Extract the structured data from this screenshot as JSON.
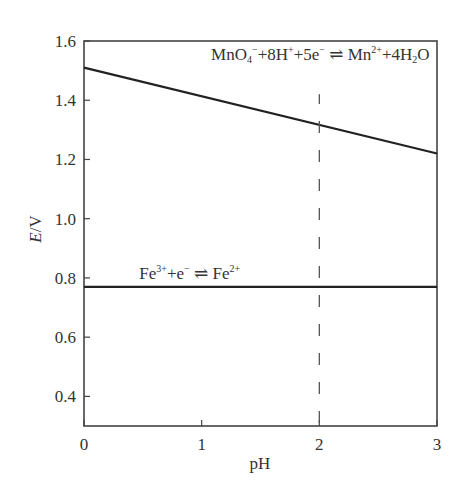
{
  "chart_data": {
    "type": "line",
    "title": "",
    "xlabel": "pH",
    "ylabel_italic": "E",
    "ylabel_rest": "/V",
    "ylabel": "E/V",
    "xlim": [
      0,
      3
    ],
    "ylim": [
      0.3,
      1.6
    ],
    "grid": false,
    "legend": "none",
    "xticks": [
      0,
      1,
      2,
      3
    ],
    "xtick_labels": [
      "0",
      "1",
      "2",
      "3"
    ],
    "yticks": [
      0.4,
      0.6,
      0.8,
      1.0,
      1.2,
      1.4,
      1.6
    ],
    "ytick_labels": [
      "0.4",
      "0.6",
      "0.8",
      "1.0",
      "1.2",
      "1.4",
      "1.6"
    ],
    "series": [
      {
        "name": "MnO4- + 8H+ + 5e- ⇌ Mn2+ + 4H2O",
        "style": "solid",
        "x": [
          0,
          3
        ],
        "values": [
          1.51,
          1.22
        ]
      },
      {
        "name": "Fe3+ + e- ⇌ Fe2+",
        "style": "solid",
        "x": [
          0,
          3
        ],
        "values": [
          0.77,
          0.77
        ]
      },
      {
        "name": "pH = 2 reference",
        "style": "dashed",
        "x": [
          2,
          2
        ],
        "values": [
          0.31,
          1.42
        ]
      }
    ],
    "annotations": [
      {
        "id": "mno4",
        "parts": [
          {
            "t": "MnO",
            "s": "n"
          },
          {
            "t": "4",
            "s": "sub"
          },
          {
            "t": "−",
            "s": "sup"
          },
          {
            "t": "+8H",
            "s": "n"
          },
          {
            "t": "+",
            "s": "sup"
          },
          {
            "t": "+5e",
            "s": "n"
          },
          {
            "t": "−",
            "s": "sup"
          },
          {
            "t": " ⇌ Mn",
            "s": "n"
          },
          {
            "t": "2+",
            "s": "sup"
          },
          {
            "t": "+4H",
            "s": "n"
          },
          {
            "t": "2",
            "s": "sub"
          },
          {
            "t": "O",
            "s": "n"
          }
        ],
        "x": 1.08,
        "y": 1.535
      },
      {
        "id": "fe",
        "parts": [
          {
            "t": "Fe",
            "s": "n"
          },
          {
            "t": "3+",
            "s": "sup"
          },
          {
            "t": "+e",
            "s": "n"
          },
          {
            "t": "−",
            "s": "sup"
          },
          {
            "t": " ⇌ Fe",
            "s": "n"
          },
          {
            "t": "2+",
            "s": "sup"
          }
        ],
        "x": 0.47,
        "y": 0.795
      }
    ]
  }
}
